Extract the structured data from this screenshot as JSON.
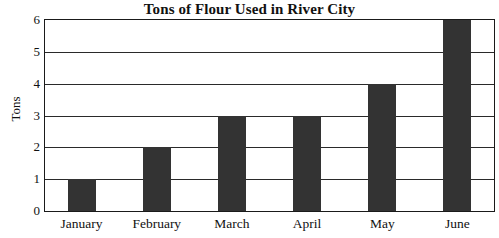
{
  "chart_data": {
    "type": "bar",
    "title": "Tons of Flour Used in River City",
    "xlabel": "",
    "ylabel": "Tons",
    "categories": [
      "January",
      "February",
      "March",
      "April",
      "May",
      "June"
    ],
    "values": [
      1,
      2,
      3,
      3,
      4,
      6
    ],
    "ylim": [
      0,
      6
    ],
    "y_ticks": [
      0,
      1,
      2,
      3,
      4,
      5,
      6
    ],
    "y_tick_labels": [
      "0",
      "1",
      "2",
      "3",
      "4",
      "5",
      "6"
    ],
    "grid": true,
    "legend": false,
    "legend_position": "none",
    "bar_color": "#333333",
    "axis_color": "#1a1a1a",
    "background_color": "#ffffff"
  }
}
